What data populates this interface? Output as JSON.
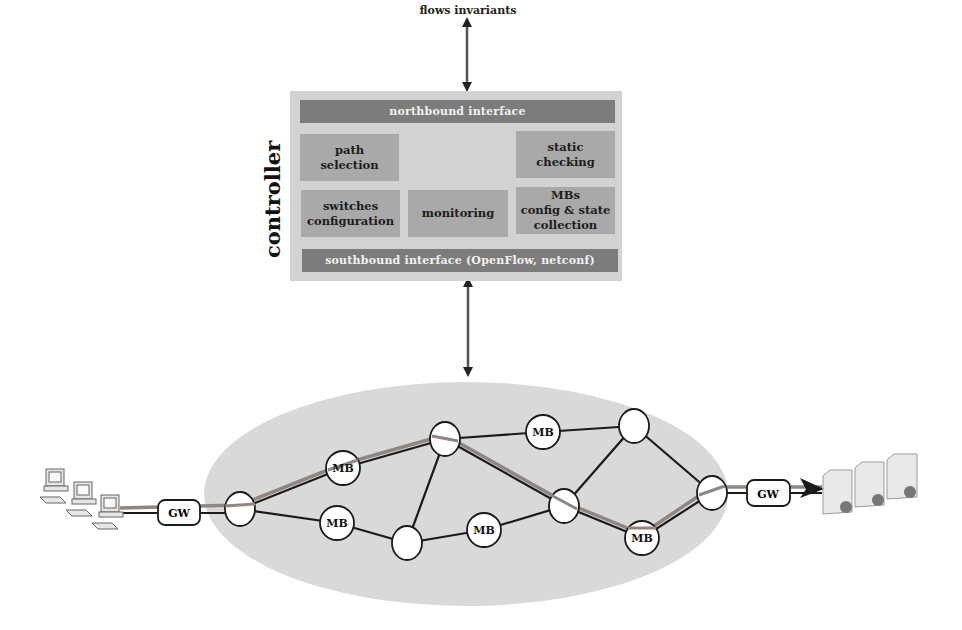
{
  "diagram": {
    "top_label": "flows invariants",
    "controller": {
      "title": "controller",
      "northbound": "northbound interface",
      "southbound": "southbound interface (OpenFlow, netconf)",
      "modules": {
        "path_selection": "path\nselection",
        "static_checking": "static\nchecking",
        "switches_configuration": "switches\nconfiguration",
        "monitoring": "monitoring",
        "mbs_config": "MBs\nconfig & state\ncollection"
      }
    },
    "network": {
      "gateways": {
        "left": "GW",
        "right": "GW"
      },
      "middleboxes": [
        "MB",
        "MB",
        "MB",
        "MB",
        "MB"
      ],
      "endpoints": {
        "left": "client-computers",
        "right": "servers"
      }
    },
    "colors": {
      "controller_bg": "#d2d2d2",
      "module_bg": "#a9a9a9",
      "interface_bar": "#7c7c7c",
      "network_cloud": "#d9d9d9",
      "path_highlight": "#8f8680"
    }
  }
}
